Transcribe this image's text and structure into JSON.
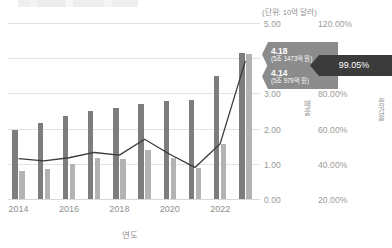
{
  "chart_data": {
    "type": "bar",
    "title": "",
    "xlabel": "연도",
    "ylabel": "매출",
    "y2label": "증가율",
    "unit_note": "(단위: 10억 달러)",
    "categories": [
      "2014",
      "2015",
      "2016",
      "2017",
      "2018",
      "2019",
      "2020",
      "2021",
      "2022",
      "2023"
    ],
    "xtick_labels": [
      "2014",
      "2016",
      "2018",
      "2020",
      "2022"
    ],
    "ylim": [
      0.0,
      5.0
    ],
    "yticks": [
      "0.00",
      "1.00",
      "2.00",
      "3.00",
      "4.00",
      "5.00"
    ],
    "y2lim": [
      20.0,
      120.0
    ],
    "y2ticks": [
      "20.00%",
      "40.00%",
      "60.00%",
      "80.00%",
      "100.00%",
      "120.00%"
    ],
    "grid": true,
    "legend": "none",
    "series": [
      {
        "name": "매출-1",
        "type": "bar",
        "color": "#7d7d7d",
        "values": [
          1.99,
          2.19,
          2.38,
          2.54,
          2.61,
          2.74,
          2.81,
          2.83,
          3.51,
          4.18
        ]
      },
      {
        "name": "매출-2",
        "type": "bar",
        "color": "#b3b3b3",
        "values": [
          0.82,
          0.89,
          1.02,
          1.18,
          1.16,
          1.43,
          1.19,
          0.9,
          1.6,
          4.14
        ]
      },
      {
        "name": "증가율",
        "type": "line",
        "color": "#3b3b3b",
        "axis": "right",
        "values": [
          43.5,
          42.2,
          44.0,
          47.0,
          45.5,
          54.5,
          46.0,
          38.5,
          52.0,
          99.05
        ]
      }
    ],
    "annotations": [
      {
        "id": "sales-callout-1",
        "value": "4.18",
        "sub": "(5조 1473억 원)",
        "color": "#8c8c8c"
      },
      {
        "id": "sales-callout-2",
        "value": "4.14",
        "sub": "(5조 979억 원)",
        "color": "#8c8c8c"
      },
      {
        "id": "rate-callout",
        "value": "99.05%",
        "sub": "",
        "color": "#3b3b3b"
      }
    ]
  }
}
